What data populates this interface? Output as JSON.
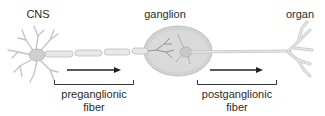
{
  "labels": {
    "cns": "CNS",
    "ganglion": "ganglion",
    "organ": "organ"
  },
  "fibers": [
    {
      "id": "preganglionic",
      "line1": "preganglionic",
      "line2": "fiber"
    },
    {
      "id": "postganglionic",
      "line1": "postganglionic",
      "line2": "fiber"
    }
  ],
  "colors": {
    "neuron_fill": "#e6e6e6",
    "neuron_stroke": "#b5b5b5",
    "ganglion_fill": "#d0d0d0",
    "arrow": "#222222",
    "text": "#2b2b2b"
  }
}
